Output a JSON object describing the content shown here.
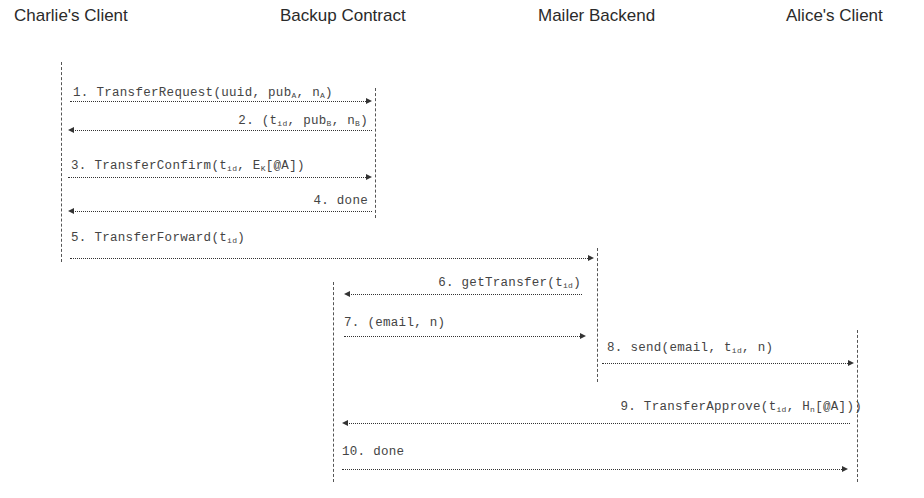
{
  "diagram": {
    "type": "sequence",
    "actors": [
      {
        "id": "charlie",
        "label": "Charlie's Client"
      },
      {
        "id": "backup",
        "label": "Backup Contract"
      },
      {
        "id": "mailer",
        "label": "Mailer Backend"
      },
      {
        "id": "alice",
        "label": "Alice's Client"
      }
    ],
    "messages": [
      {
        "n": "1",
        "from": "charlie",
        "to": "backup",
        "prefix": "1. TransferRequest(uuid, pub",
        "sub1": "A",
        "mid1": ", n",
        "sub2": "A",
        "suffix": ")"
      },
      {
        "n": "2",
        "from": "backup",
        "to": "charlie",
        "prefix": "2. (t",
        "sub1": "id",
        "mid1": ", pub",
        "sub2": "B",
        "mid2": ", n",
        "sub3": "B",
        "suffix": ")"
      },
      {
        "n": "3",
        "from": "charlie",
        "to": "backup",
        "prefix": "3. TransferConfirm(t",
        "sub1": "id",
        "mid1": ", E",
        "sub2": "K",
        "suffix": "[@A])"
      },
      {
        "n": "4",
        "from": "backup",
        "to": "charlie",
        "text": "4. done"
      },
      {
        "n": "5",
        "from": "charlie",
        "to": "mailer",
        "prefix": "5. TransferForward(t",
        "sub1": "id",
        "suffix": ")"
      },
      {
        "n": "6",
        "from": "mailer",
        "to": "backup",
        "prefix": "6. getTransfer(t",
        "sub1": "id",
        "suffix": ")"
      },
      {
        "n": "7",
        "from": "backup",
        "to": "mailer",
        "text": "7. (email, n)"
      },
      {
        "n": "8",
        "from": "mailer",
        "to": "alice",
        "prefix": "8. send(email, t",
        "sub1": "id",
        "suffix": ", n)"
      },
      {
        "n": "9",
        "from": "alice",
        "to": "backup",
        "prefix": "9. TransferApprove(t",
        "sub1": "id",
        "mid1": ", H",
        "sub2": "n",
        "suffix": "[@A]))"
      },
      {
        "n": "10",
        "from": "backup",
        "to": "alice",
        "text": "10. done"
      }
    ]
  }
}
